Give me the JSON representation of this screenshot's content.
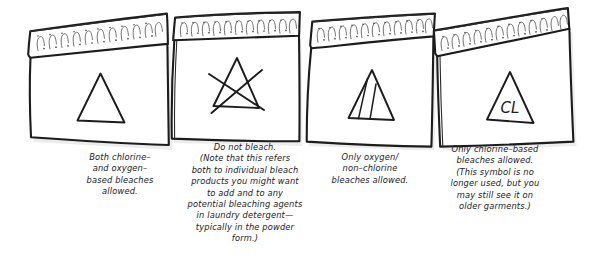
{
  "figure": {
    "ink_color": "#1c1c1c",
    "tag_fill": "#ffffff",
    "shadow_color": "#d8d8d8",
    "text_color": "#20201f"
  },
  "tags": [
    {
      "id": "tag-1",
      "symbol_name": "plain-triangle",
      "symbol_text": "",
      "meaning": "Both chlorine- and oxygen-based bleaches allowed."
    },
    {
      "id": "tag-2",
      "symbol_name": "triangle-crossed-out",
      "symbol_text": "",
      "meaning": "Do not bleach."
    },
    {
      "id": "tag-3",
      "symbol_name": "triangle-with-diagonal-stripes",
      "symbol_text": "",
      "meaning": "Only oxygen / non-chlorine bleaches allowed."
    },
    {
      "id": "tag-4",
      "symbol_name": "triangle-with-cl",
      "symbol_text": "CL",
      "meaning": "Only chlorine-based bleaches allowed."
    }
  ],
  "captions": [
    {
      "id": "caption-1",
      "text": "Both chlorine–\nand oxygen–\nbased bleaches\nallowed."
    },
    {
      "id": "caption-2",
      "text": "Do not bleach.\n(Note that this refers\nboth to individual bleach\nproducts you might want\nto add and to any\npotential bleaching agents\nin laundry detergent—\ntypically in the powder\nform.)"
    },
    {
      "id": "caption-3",
      "text": "Only oxygen/\nnon–chlorine\nbleaches allowed."
    },
    {
      "id": "caption-4",
      "text": "Only chlorine–based\nbleaches allowed.\n(This symbol is no\nlonger used, but you\nmay still see it on\nolder garments.)"
    }
  ]
}
